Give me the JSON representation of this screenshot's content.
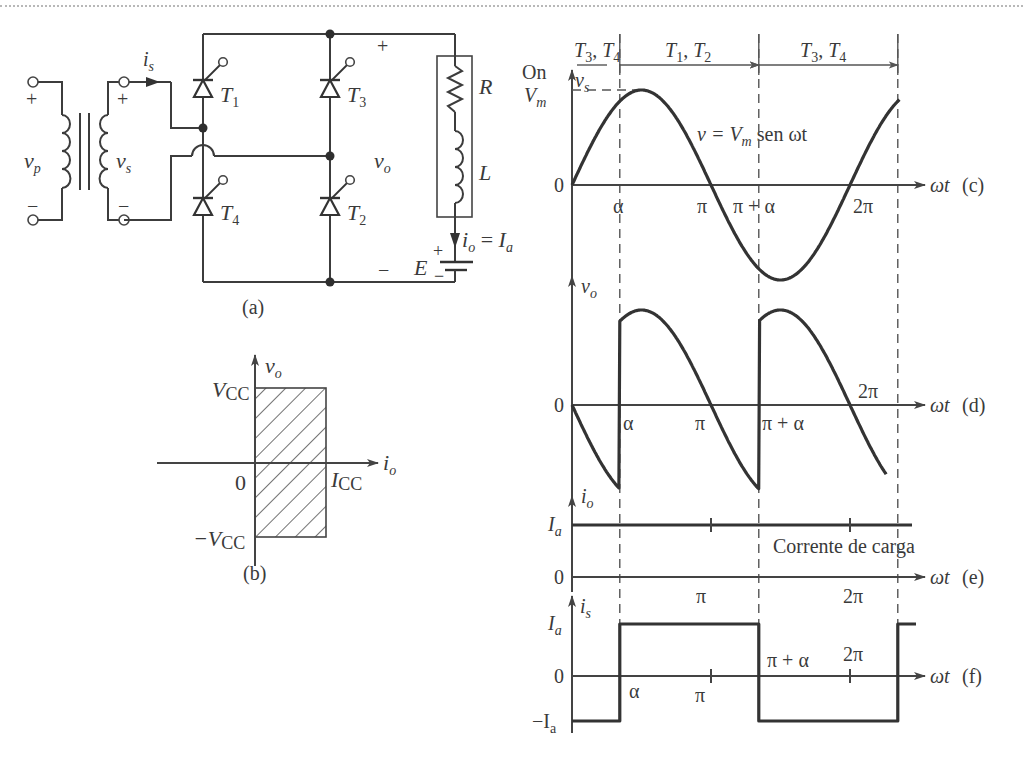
{
  "figure": {
    "panel_labels": {
      "a": "(a)",
      "b": "(b)",
      "c": "(c)",
      "d": "(d)",
      "e": "(e)",
      "f": "(f)"
    }
  },
  "circuit": {
    "primary_voltage": "v",
    "primary_voltage_sub": "p",
    "secondary_voltage": "v",
    "secondary_voltage_sub": "s",
    "secondary_current": "i",
    "secondary_current_sub": "s",
    "plus": "+",
    "minus": "−",
    "thyristors": [
      {
        "name": "T",
        "sub": "1"
      },
      {
        "name": "T",
        "sub": "3"
      },
      {
        "name": "T",
        "sub": "4"
      },
      {
        "name": "T",
        "sub": "2"
      }
    ],
    "load_resistor": "R",
    "load_inductor": "L",
    "output_voltage": "v",
    "output_voltage_sub": "o",
    "load_current": "i",
    "load_current_sub": "o",
    "load_current_eq": " = ",
    "load_current_value": "I",
    "load_current_value_sub": "a",
    "battery": "E"
  },
  "quadrant": {
    "y_label": "v",
    "y_label_sub": "o",
    "x_label": "i",
    "x_label_sub": "o",
    "v_pos": "V",
    "v_pos_sub": "CC",
    "v_neg": "−V",
    "v_neg_sub": "CC",
    "i_max": "I",
    "i_max_sub": "CC",
    "origin": "0",
    "operating_region": "quadrants I and IV (io ≥ 0, |vo| ≤ VCC)"
  },
  "chart_data": {
    "type": "line",
    "title": "",
    "xlabel": "ωt",
    "x_unit": "rad",
    "firing_angle_alpha_rad": 1.08,
    "x_range": [
      0,
      7.4
    ],
    "conduction_intervals": [
      {
        "label_main": "T",
        "label_sub1": "3",
        "sep": ", ",
        "label_main2": "T",
        "label_sub2": "4",
        "from": "0",
        "to": "α"
      },
      {
        "label_main": "T",
        "label_sub1": "1",
        "sep": ", ",
        "label_main2": "T",
        "label_sub2": "2",
        "from": "α",
        "to": "π + α"
      },
      {
        "label_main": "T",
        "label_sub1": "3",
        "sep": ", ",
        "label_main2": "T",
        "label_sub2": "4",
        "from": "π + α",
        "to": "2π + α"
      }
    ],
    "on_label": "On",
    "panels": [
      {
        "id": "c",
        "ylabel": "v",
        "ylabel_sub": "s",
        "y_ticks": [
          {
            "label": "V",
            "sub": "m",
            "value": 1
          },
          {
            "label": "0",
            "value": 0
          }
        ],
        "x_ticks": [
          "α",
          "π",
          "π + α",
          "2π"
        ],
        "annotation": {
          "lhs": "v = ",
          "main": "V",
          "sub": "m",
          "rest": " sen ωt"
        },
        "series": [
          {
            "name": "v_s",
            "formula": "Vm·sin(ωt)",
            "amplitude": 1,
            "x": [
              0,
              7.4
            ]
          }
        ]
      },
      {
        "id": "d",
        "ylabel": "v",
        "ylabel_sub": "o",
        "y_ticks": [
          {
            "label": "0",
            "value": 0
          }
        ],
        "x_ticks": [
          "α",
          "π",
          "π + α",
          "2π"
        ],
        "series": [
          {
            "name": "v_o",
            "formula": "±Vm·sin(ωt) switched at α, π+α, 2π+α",
            "amplitude": 1
          }
        ]
      },
      {
        "id": "e",
        "ylabel": "i",
        "ylabel_sub": "o",
        "y_ticks": [
          {
            "label": "I",
            "sub": "a",
            "value": 1
          },
          {
            "label": "0",
            "value": 0
          }
        ],
        "x_ticks": [
          "π",
          "2π"
        ],
        "annotation": {
          "text": "Corrente de carga"
        },
        "series": [
          {
            "name": "i_o",
            "values": "constant Ia",
            "value": 1
          }
        ]
      },
      {
        "id": "f",
        "ylabel": "i",
        "ylabel_sub": "s",
        "y_ticks": [
          {
            "label": "I",
            "sub": "a",
            "value": 1
          },
          {
            "label": "0",
            "value": 0
          },
          {
            "label": "−I",
            "sub": "a",
            "value": -1
          }
        ],
        "x_ticks": [
          "α",
          "π",
          "π + α",
          "2π"
        ],
        "series": [
          {
            "name": "i_s",
            "steps": [
              {
                "from": 0,
                "to": "α",
                "value": -1
              },
              {
                "from": "α",
                "to": "π + α",
                "value": 1
              },
              {
                "from": "π + α",
                "to": "2π + α",
                "value": -1
              },
              {
                "from": "2π + α",
                "to": "end",
                "value": 1
              }
            ]
          }
        ]
      }
    ]
  }
}
